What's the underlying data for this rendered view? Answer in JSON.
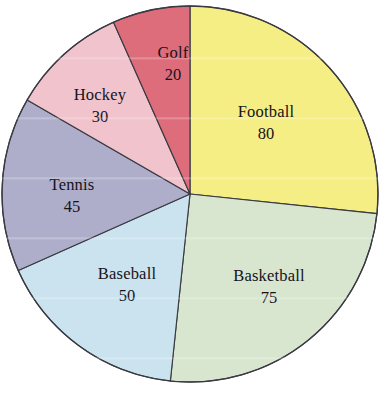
{
  "chart_data": {
    "type": "pie",
    "title": "",
    "subtitle": "",
    "xlabel": "",
    "ylabel": "",
    "legend_position": "none",
    "grid": false,
    "labels_inside_slices": true,
    "start_angle_deg": 0,
    "direction": "clockwise",
    "total": 300,
    "categories": [
      "Football",
      "Basketball",
      "Baseball",
      "Tennis",
      "Hockey",
      "Golf"
    ],
    "values": [
      80,
      75,
      50,
      45,
      30,
      20
    ],
    "slices": [
      {
        "label": "Football",
        "value": "80",
        "value_number": 80,
        "angle_deg": 96,
        "color": "#f5ee85",
        "label_x": 266,
        "label_y": 113,
        "value_x": 266,
        "value_y": 135
      },
      {
        "label": "Basketball",
        "value": "75",
        "value_number": 75,
        "angle_deg": 90,
        "color": "#d8e5cf",
        "label_x": 269,
        "label_y": 277,
        "value_x": 269,
        "value_y": 299
      },
      {
        "label": "Baseball",
        "value": "50",
        "value_number": 50,
        "angle_deg": 60,
        "color": "#cbe3ef",
        "label_x": 127,
        "label_y": 275,
        "value_x": 127,
        "value_y": 297
      },
      {
        "label": "Tennis",
        "value": "45",
        "value_number": 45,
        "angle_deg": 54,
        "color": "#aeaecb",
        "label_x": 72,
        "label_y": 186,
        "value_x": 72,
        "value_y": 208
      },
      {
        "label": "Hockey",
        "value": "30",
        "value_number": 30,
        "angle_deg": 36,
        "color": "#f0c3cd",
        "label_x": 100,
        "label_y": 96,
        "value_x": 100,
        "value_y": 118
      },
      {
        "label": "Golf",
        "value": "20",
        "value_number": 20,
        "angle_deg": 24,
        "color": "#de6d7c",
        "label_x": 173,
        "label_y": 54,
        "value_x": 173,
        "value_y": 76
      }
    ],
    "geometry": {
      "center_x": 190,
      "center_y": 194,
      "radius": 188
    },
    "colors": {
      "outline": "#3a3a42",
      "background": "#ffffff",
      "label_text": "#14131a"
    }
  }
}
